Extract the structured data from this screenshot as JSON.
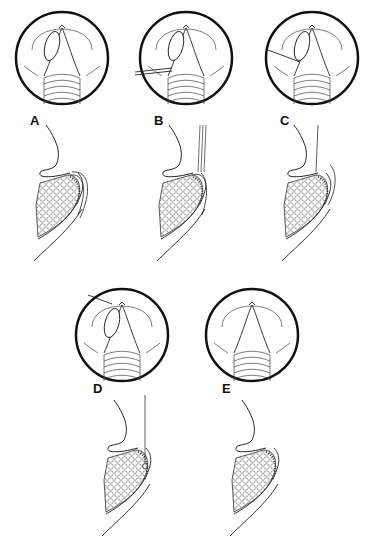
{
  "figure": {
    "type": "medical-illustration",
    "colors": {
      "line": "#222222",
      "background": "#ffffff",
      "stipple": "#555555"
    },
    "panels": [
      {
        "id": "A",
        "label": "A",
        "instrument": "none",
        "view": "endoscopic-circle",
        "section": "sagittal-with-layered-flap"
      },
      {
        "id": "B",
        "label": "B",
        "instrument": "forceps",
        "view": "endoscopic-circle",
        "section": "sagittal-with-forceps"
      },
      {
        "id": "C",
        "label": "C",
        "instrument": "needle",
        "view": "endoscopic-circle",
        "section": "sagittal-with-needle"
      },
      {
        "id": "D",
        "label": "D",
        "instrument": "suture",
        "view": "endoscopic-circle",
        "section": "sagittal-with-suture"
      },
      {
        "id": "E",
        "label": "E",
        "instrument": "none",
        "view": "endoscopic-circle",
        "section": "sagittal-healed"
      }
    ]
  }
}
